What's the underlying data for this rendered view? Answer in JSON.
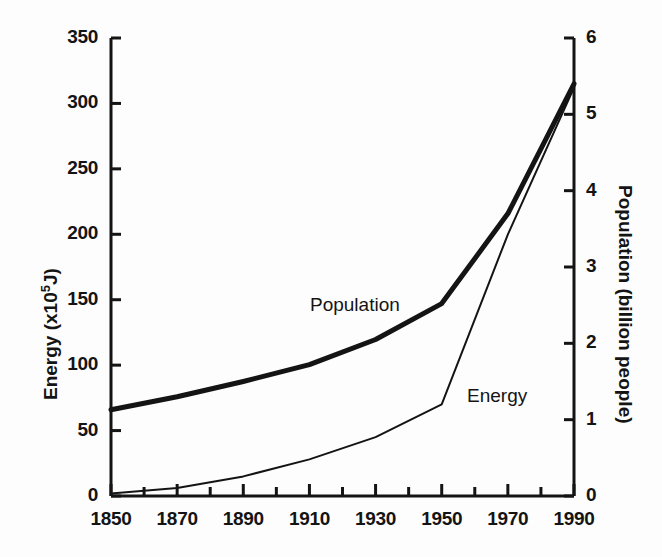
{
  "figure": {
    "background_color": "#fdfdfd",
    "ink_color": "#141414"
  },
  "chart_data": {
    "type": "line",
    "title": "",
    "xlabel": "",
    "ylabel": "Energy (x10<sup>5</sup>J)",
    "y2label": "Population (billion people)",
    "x": [
      1850,
      1870,
      1890,
      1910,
      1930,
      1950,
      1970,
      1990
    ],
    "xlim": [
      1850,
      1990
    ],
    "xticks": [
      1850,
      1870,
      1890,
      1910,
      1930,
      1950,
      1970,
      1990
    ],
    "xticklabels": [
      "1850",
      "1870",
      "1890",
      "1910",
      "1930",
      "1950",
      "1970",
      "1990"
    ],
    "xminor_ticks": [
      1860,
      1880,
      1900,
      1920,
      1940,
      1960,
      1980
    ],
    "ylim": [
      0,
      350
    ],
    "yticks": [
      0,
      50,
      100,
      150,
      200,
      250,
      300,
      350
    ],
    "yticklabels": [
      "0",
      "50",
      "100",
      "150",
      "200",
      "250",
      "300",
      "350"
    ],
    "y2lim": [
      0,
      6
    ],
    "y2ticks": [
      0,
      1,
      2,
      3,
      4,
      5,
      6
    ],
    "y2ticklabels": [
      "0",
      "1",
      "2",
      "3",
      "4",
      "5",
      "6"
    ],
    "grid": false,
    "legend": "inline-annotations",
    "series": [
      {
        "name": "Population",
        "axis": "right",
        "units": "billion people",
        "line_width": "thick",
        "color": "#141414",
        "values": [
          1.13,
          1.3,
          1.5,
          1.72,
          2.05,
          2.52,
          3.7,
          5.4
        ],
        "left_axis_equivalent": [
          66,
          76,
          87,
          100,
          120,
          147,
          216,
          315
        ],
        "label_position": {
          "x": 310,
          "y": 294
        }
      },
      {
        "name": "Energy",
        "axis": "left",
        "units": "x10^5 J",
        "line_width": "thin",
        "color": "#141414",
        "values": [
          2,
          6,
          15,
          28,
          45,
          70,
          200,
          312
        ],
        "right_axis_equivalent": [
          0.03,
          0.1,
          0.26,
          0.48,
          0.77,
          1.2,
          3.43,
          5.35
        ],
        "label_position": {
          "x": 467,
          "y": 385
        }
      }
    ]
  },
  "axes": {
    "left_axis_name": "Energy",
    "left_axis_unit_prefix": "(x10",
    "left_axis_unit_exponent": "5",
    "left_axis_unit_suffix": "J)",
    "right_axis_name": "Population (billion people)"
  },
  "annotations": {
    "population_label": "Population",
    "energy_label": "Energy"
  }
}
